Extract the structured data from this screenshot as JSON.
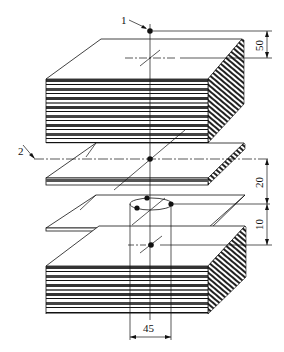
{
  "diagram": {
    "type": "technical-drawing",
    "callouts": [
      {
        "id": "1",
        "label": "1",
        "target": "top reference point"
      },
      {
        "id": "2",
        "label": "2",
        "target": "center-line reference axis"
      }
    ],
    "dimensions": [
      {
        "label": "50",
        "orientation": "vertical",
        "position": "right-top"
      },
      {
        "label": "20",
        "orientation": "vertical",
        "position": "right-middle"
      },
      {
        "label": "10",
        "orientation": "vertical",
        "position": "right-lower"
      },
      {
        "label": "45",
        "orientation": "horizontal",
        "position": "bottom-center"
      }
    ],
    "components": [
      {
        "name": "top-sheet-stack",
        "layers": 7
      },
      {
        "name": "single-plate-upper"
      },
      {
        "name": "single-plate-lower"
      },
      {
        "name": "bottom-sheet-stack",
        "layers": 6
      }
    ],
    "colors": {
      "line": "#111111",
      "fill": "#ffffff",
      "shade": "#555555"
    }
  }
}
